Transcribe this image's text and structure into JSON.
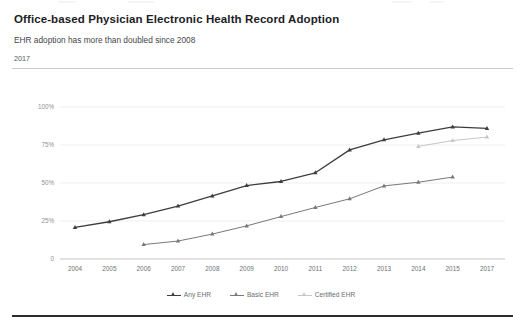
{
  "header": {
    "title": "Office-based Physician Electronic Health Record Adoption",
    "subtitle": "EHR adoption has more than doubled since 2008",
    "period": "2017"
  },
  "colors": {
    "any_ehr": "#3d3d40",
    "basic_ehr": "#77797d",
    "certified_ehr": "#c4c6c9",
    "grid": "#e4e6e8",
    "axis": "#b9bcbf",
    "title_text": "#1d1d1f",
    "muted_text": "#6e7175",
    "bottom_border": "#2b2c2e"
  },
  "chart_data": {
    "type": "line",
    "title": "Office-based Physician Electronic Health Record Adoption",
    "subtitle": "EHR adoption has more than doubled since 2008",
    "xlabel": "",
    "ylabel": "",
    "ylim": [
      0,
      100
    ],
    "yticks": [
      0,
      25,
      50,
      75,
      100
    ],
    "ytick_labels": [
      "0",
      "25%",
      "50%",
      "75%",
      "100%"
    ],
    "grid": true,
    "legend_position": "bottom-center",
    "x": [
      2004,
      2005,
      2006,
      2007,
      2008,
      2009,
      2010,
      2011,
      2012,
      2013,
      2014,
      2015,
      2017
    ],
    "xtick_labels": [
      "2004",
      "2005",
      "2006",
      "2007",
      "2008",
      "2009",
      "2010",
      "2011",
      "2012",
      "2013",
      "2014",
      "2015",
      "2017"
    ],
    "series": [
      {
        "name": "Any EHR",
        "color": "#3d3d40",
        "marker": "triangle",
        "values": [
          20.8,
          24.5,
          29.2,
          34.8,
          41.5,
          48.3,
          51.0,
          56.7,
          71.8,
          78.4,
          82.8,
          86.9,
          85.9
        ]
      },
      {
        "name": "Basic EHR",
        "color": "#77797d",
        "marker": "triangle",
        "values": [
          null,
          null,
          9.5,
          11.8,
          16.4,
          21.8,
          27.9,
          33.9,
          39.6,
          48.1,
          50.5,
          53.9,
          null
        ]
      },
      {
        "name": "Certified EHR",
        "color": "#c4c6c9",
        "marker": "triangle",
        "values": [
          null,
          null,
          null,
          null,
          null,
          null,
          null,
          null,
          null,
          null,
          74.1,
          77.9,
          80.2
        ]
      }
    ]
  },
  "legend": [
    {
      "label": "Any EHR",
      "color": "#3d3d40"
    },
    {
      "label": "Basic EHR",
      "color": "#77797d"
    },
    {
      "label": "Certified EHR",
      "color": "#c4c6c9"
    }
  ]
}
